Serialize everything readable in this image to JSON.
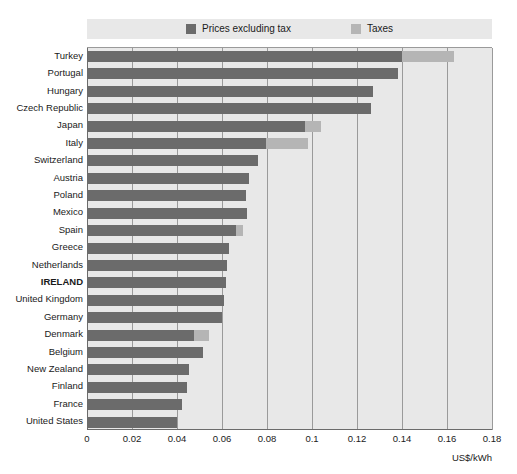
{
  "chart_data": {
    "type": "bar",
    "orientation": "horizontal",
    "stacked": true,
    "title": "",
    "xlabel": "US$/kWh",
    "ylabel": "",
    "xlim": [
      0,
      0.18
    ],
    "xticks": [
      "0",
      "0.02",
      "0.04",
      "0.06",
      "0.08",
      "0.1",
      "0.12",
      "0.14",
      "0.16",
      "0.18"
    ],
    "xtick_values": [
      0,
      0.02,
      0.04,
      0.06,
      0.08,
      0.1,
      0.12,
      0.14,
      0.16,
      0.18
    ],
    "grid": true,
    "legend_position": "top",
    "categories": [
      "Turkey",
      "Portugal",
      "Hungary",
      "Czech Republic",
      "Japan",
      "Italy",
      "Switzerland",
      "Austria",
      "Poland",
      "Mexico",
      "Spain",
      "Greece",
      "Netherlands",
      "IRELAND",
      "United Kingdom",
      "Germany",
      "Denmark",
      "Belgium",
      "New Zealand",
      "Finland",
      "France",
      "United States"
    ],
    "highlighted_category": "IRELAND",
    "series": [
      {
        "name": "Prices excluding tax",
        "color": "#6b6b6b",
        "values": [
          0.14,
          0.138,
          0.127,
          0.126,
          0.097,
          0.0795,
          0.076,
          0.072,
          0.0705,
          0.071,
          0.066,
          0.063,
          0.062,
          0.0618,
          0.061,
          0.06,
          0.0475,
          0.0515,
          0.0455,
          0.0445,
          0.042,
          0.04
        ]
      },
      {
        "name": "Taxes",
        "color": "#b5b5b5",
        "values": [
          0.023,
          0,
          0,
          0,
          0.007,
          0.0185,
          0,
          0,
          0,
          0,
          0.0035,
          0,
          0,
          0,
          0,
          0,
          0.0065,
          0,
          0,
          0,
          0,
          0
        ]
      }
    ]
  },
  "legend": {
    "items": [
      {
        "label": "Prices excluding tax",
        "color": "#6b6b6b"
      },
      {
        "label": "Taxes",
        "color": "#b5b5b5"
      }
    ]
  },
  "axis": {
    "x_unit_label": "US$/kWh"
  },
  "colors": {
    "prices_excluding_tax": "#6b6b6b",
    "taxes": "#b5b5b5",
    "plot_background": "#e8e8e8",
    "gridline": "#9a9a9a",
    "page_background": "#ffffff"
  }
}
